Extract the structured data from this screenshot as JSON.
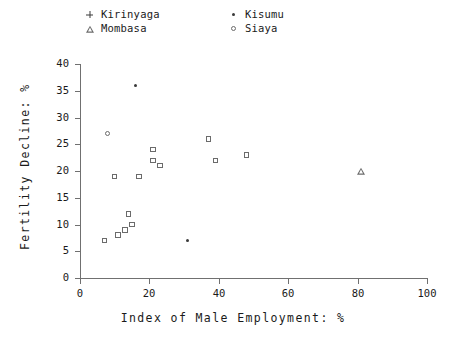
{
  "chart_data": {
    "type": "scatter",
    "title": "",
    "xlabel": "Index of Male Employment: %",
    "ylabel": "Fertility Decline: %",
    "xlim": [
      0,
      100
    ],
    "ylim": [
      0,
      40
    ],
    "xticks": [
      0,
      20,
      40,
      60,
      80,
      100
    ],
    "yticks": [
      0,
      5,
      10,
      15,
      20,
      25,
      30,
      35,
      40
    ],
    "grid": false,
    "legend_position": "top",
    "series": [
      {
        "name": "Kirinyaga",
        "marker": "plus",
        "marker_icon": "plus-marker-icon",
        "points": []
      },
      {
        "name": "Mombasa",
        "marker": "triangle",
        "marker_icon": "triangle-marker-icon",
        "points": [
          {
            "x": 81,
            "y": 20
          }
        ]
      },
      {
        "name": "Kisumu",
        "marker": "dot",
        "marker_icon": "dot-marker-icon",
        "points": [
          {
            "x": 16,
            "y": 36
          },
          {
            "x": 31,
            "y": 7
          }
        ]
      },
      {
        "name": "Siaya",
        "marker": "circle",
        "marker_icon": "circle-marker-icon",
        "points": [
          {
            "x": 8,
            "y": 27
          }
        ]
      },
      {
        "name": "Other districts",
        "marker": "square",
        "marker_icon": "square-marker-icon",
        "points": [
          {
            "x": 7,
            "y": 7
          },
          {
            "x": 10,
            "y": 19
          },
          {
            "x": 11,
            "y": 8
          },
          {
            "x": 13,
            "y": 9
          },
          {
            "x": 14,
            "y": 12
          },
          {
            "x": 15,
            "y": 10
          },
          {
            "x": 17,
            "y": 19
          },
          {
            "x": 21,
            "y": 24
          },
          {
            "x": 21,
            "y": 22
          },
          {
            "x": 23,
            "y": 21
          },
          {
            "x": 37,
            "y": 26
          },
          {
            "x": 39,
            "y": 22
          },
          {
            "x": 48,
            "y": 23
          }
        ]
      }
    ]
  },
  "legend": {
    "entries": [
      {
        "label": "Kirinyaga",
        "marker": "plus"
      },
      {
        "label": "Kisumu",
        "marker": "dot"
      },
      {
        "label": "Mombasa",
        "marker": "triangle"
      },
      {
        "label": "Siaya",
        "marker": "circle"
      }
    ]
  }
}
